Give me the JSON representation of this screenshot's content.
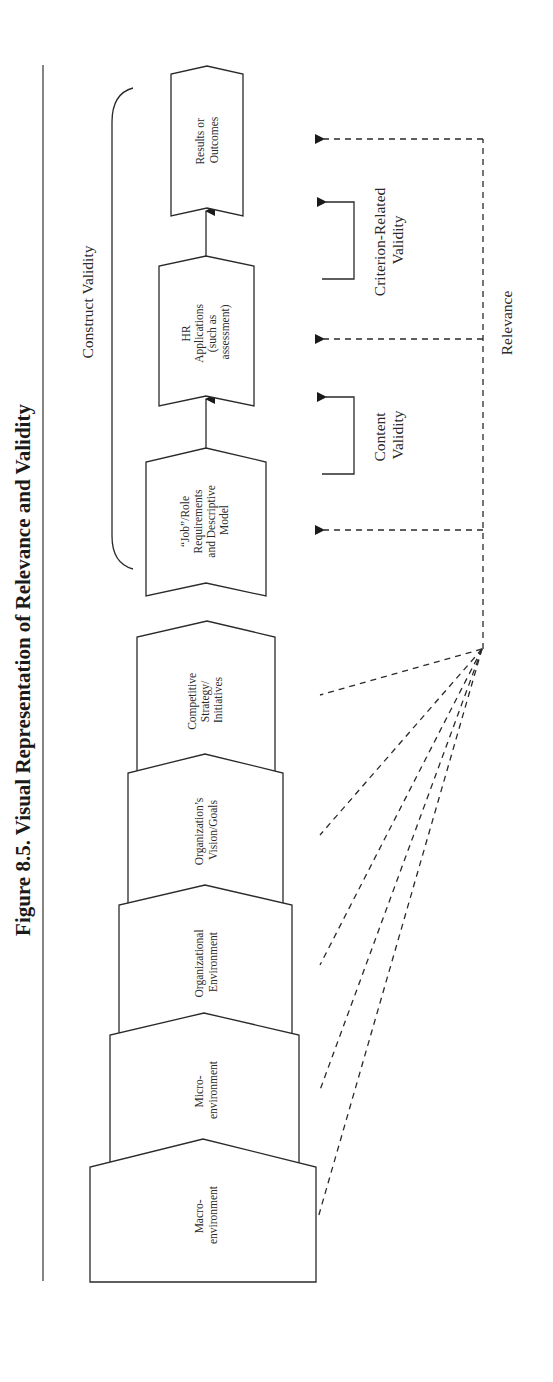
{
  "figure": {
    "title": "Figure 8.5.  Visual Representation of Relevance and Validity",
    "orientation": "rotated-90-ccw"
  },
  "context_stack": [
    {
      "id": "macro",
      "lines": [
        "Macro-",
        "environment"
      ]
    },
    {
      "id": "micro",
      "lines": [
        "Micro-",
        "environment"
      ]
    },
    {
      "id": "org-env",
      "lines": [
        "Organizational",
        "Environment"
      ]
    },
    {
      "id": "org-vision",
      "lines": [
        "Organization’s",
        "Vision/Goals"
      ]
    },
    {
      "id": "competitive",
      "lines": [
        "Competitive",
        "Strategy/",
        "Initiatives"
      ]
    }
  ],
  "flow_boxes": [
    {
      "id": "job-role",
      "lines": [
        "“Job”/Role",
        "Requirements",
        "and Descriptive",
        "Model"
      ]
    },
    {
      "id": "hr-applications",
      "lines": [
        "HR",
        "Applications",
        "(such as",
        "assessment)"
      ]
    },
    {
      "id": "results",
      "lines": [
        "Results or",
        "Outcomes"
      ]
    }
  ],
  "labels": {
    "construct_validity": "Construct Validity",
    "content_validity": [
      "Content",
      "Validity"
    ],
    "criterion_validity": [
      "Criterion-Related",
      "Validity"
    ],
    "relevance": "Relevance"
  },
  "colors": {
    "ink": "#2a2a2a",
    "background": "#ffffff"
  }
}
